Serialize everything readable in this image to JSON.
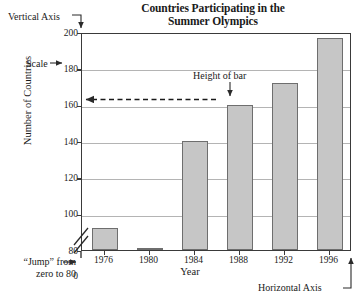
{
  "chart_data": {
    "type": "bar",
    "title": "Countries Participating in the Summer Olympics",
    "title_line1": "Countries Participating in the",
    "title_line2": "Summer Olympics",
    "xlabel": "Year",
    "ylabel": "Number of Countries",
    "categories": [
      "1976",
      "1980",
      "1984",
      "1988",
      "1992",
      "1996"
    ],
    "values": [
      92,
      81,
      140,
      160,
      172,
      197
    ],
    "ylim": [
      80,
      200
    ],
    "y_axis_broken": true,
    "y_break_from": 0,
    "y_break_to": 80,
    "yticks": [
      "0",
      "80",
      "100",
      "120",
      "140",
      "160",
      "180",
      "200"
    ],
    "ytick_values": [
      0,
      80,
      100,
      120,
      140,
      160,
      180,
      200
    ],
    "gridlines": [
      80,
      100,
      120,
      140,
      160,
      180
    ],
    "grid": true,
    "legend": "none",
    "bar_color": "#c6c6c6",
    "bar_border_color": "#6e6e6e",
    "grid_color": "#b4b4b4",
    "axis_color": "#3a3a3a",
    "annotations": [
      {
        "name": "vertical-axis",
        "text": "Vertical Axis"
      },
      {
        "name": "scale",
        "text": "Scale"
      },
      {
        "name": "height-of-bar",
        "text": "Height of bar",
        "points_to_value": 160,
        "points_to_category": "1988"
      },
      {
        "name": "jump",
        "text": "“Jump” from zero to 80",
        "line1": "“Jump” from",
        "line2": "zero to 80"
      },
      {
        "name": "horizontal-axis",
        "text": "Horizontal Axis"
      }
    ]
  },
  "chart": {
    "title_line1": "Countries Participating in the",
    "title_line2": "Summer Olympics",
    "xlabel": "Year",
    "ylabel": "Number of Countries"
  },
  "annotations": {
    "vertical_axis": "Vertical Axis",
    "scale": "Scale",
    "height_of_bar": "Height of bar",
    "jump_line1": "“Jump” from",
    "jump_line2": "zero to 80",
    "horizontal_axis": "Horizontal Axis"
  }
}
